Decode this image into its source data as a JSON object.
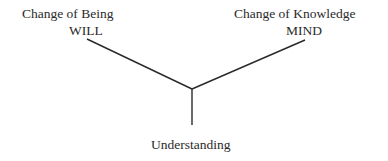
{
  "diagram": {
    "nodes": [
      {
        "id": "being",
        "title": "Change of Being",
        "subtitle": "WILL"
      },
      {
        "id": "knowledge",
        "title": "Change of Knowledge",
        "subtitle": "MIND"
      },
      {
        "id": "understanding",
        "title": "Understanding"
      }
    ],
    "edges": [
      {
        "from": "being",
        "to": "junction"
      },
      {
        "from": "knowledge",
        "to": "junction"
      },
      {
        "from": "junction",
        "to": "understanding"
      }
    ],
    "line_color": "#2a2a2a"
  }
}
